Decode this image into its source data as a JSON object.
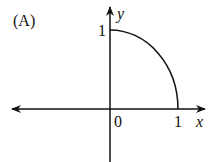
{
  "figure": {
    "label": "(A)",
    "x_axis_label": "x",
    "y_axis_label": "y",
    "origin_label": "0",
    "x_tick_label": "1",
    "y_tick_label": "1",
    "curve": "quarter circle x^2 + y^2 = 1 in first quadrant, from (0,1) to (1,0)",
    "stroke_color": "#111111"
  }
}
